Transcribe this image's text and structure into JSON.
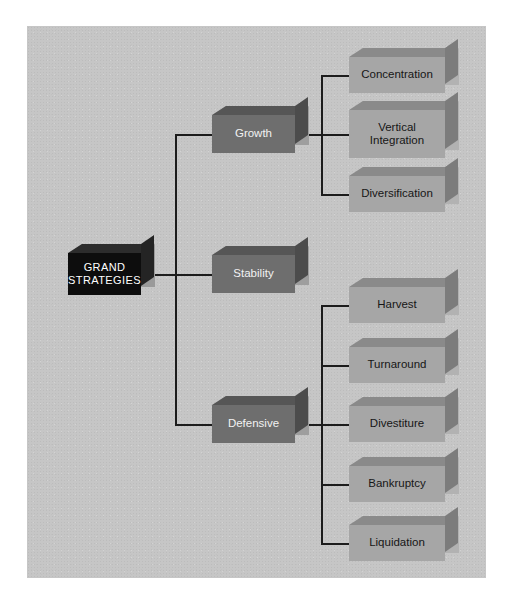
{
  "diagram": {
    "root": {
      "label": "GRAND\nSTRATEGIES",
      "line1": "GRAND",
      "line2": "STRATEGIES"
    },
    "branches": [
      {
        "label": "Growth",
        "children": [
          {
            "label": "Concentration"
          },
          {
            "label": "Vertical Integration",
            "line1": "Vertical",
            "line2": "Integration"
          },
          {
            "label": "Diversification"
          }
        ]
      },
      {
        "label": "Stability",
        "children": []
      },
      {
        "label": "Defensive",
        "children": [
          {
            "label": "Harvest"
          },
          {
            "label": "Turnaround"
          },
          {
            "label": "Divestiture"
          },
          {
            "label": "Bankruptcy"
          },
          {
            "label": "Liquidation"
          }
        ]
      }
    ],
    "colors": {
      "background": "#c6c6c6",
      "root_face": "#0d0d0d",
      "root_text": "#ffffff",
      "mid_face": "#6e6e6e",
      "mid_text": "#f2f2f2",
      "leaf_face": "#a6a6a6",
      "leaf_text": "#161616",
      "connector": "#1c1c1c"
    }
  }
}
